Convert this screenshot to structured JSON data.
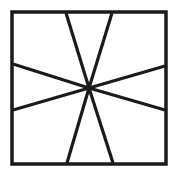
{
  "figure": {
    "background_color": "#ffffff",
    "stroke_color": "#1a1a1a",
    "canvas": {
      "width": 179,
      "height": 178
    }
  },
  "chart_data": {
    "type": "diagram",
    "xlabel": "",
    "ylabel": "",
    "xlim": [
      0,
      179
    ],
    "ylim": [
      0,
      178
    ],
    "grid": false,
    "legend": "none",
    "frame": {
      "name": "outer-square",
      "x": 12,
      "y": 12,
      "width": 154,
      "height": 152,
      "stroke_width": 3.5,
      "stroke_color": "#1a1a1a"
    },
    "center_point": {
      "x": 89,
      "y": 88
    },
    "segments": [
      {
        "name": "segment-top-left",
        "x1": 66,
        "y1": 13,
        "x2": 89,
        "y2": 88,
        "stroke_width": 3.2
      },
      {
        "name": "segment-top-right",
        "x1": 112,
        "y1": 13,
        "x2": 89,
        "y2": 88,
        "stroke_width": 3.2
      },
      {
        "name": "segment-left-upper",
        "x1": 13,
        "y1": 64,
        "x2": 89,
        "y2": 88,
        "stroke_width": 3.2
      },
      {
        "name": "segment-left-lower",
        "x1": 13,
        "y1": 110,
        "x2": 89,
        "y2": 88,
        "stroke_width": 3.2
      },
      {
        "name": "segment-right-upper",
        "x1": 165,
        "y1": 66,
        "x2": 89,
        "y2": 88,
        "stroke_width": 3.2
      },
      {
        "name": "segment-right-lower",
        "x1": 165,
        "y1": 110,
        "x2": 89,
        "y2": 88,
        "stroke_width": 3.2
      },
      {
        "name": "segment-bottom-left",
        "x1": 67,
        "y1": 163,
        "x2": 89,
        "y2": 88,
        "stroke_width": 3.2
      },
      {
        "name": "segment-bottom-right",
        "x1": 113,
        "y1": 163,
        "x2": 89,
        "y2": 88,
        "stroke_width": 3.2
      }
    ]
  }
}
